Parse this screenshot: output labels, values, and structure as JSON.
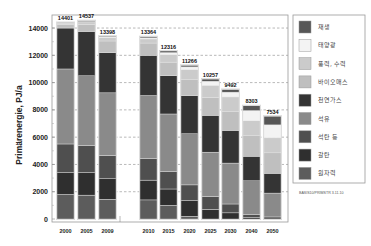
{
  "chart_data": {
    "type": "bar",
    "stacked": true,
    "title": "",
    "xlabel": "",
    "ylabel": "Primärenergie, PJ/a",
    "ylim": [
      0,
      15000
    ],
    "yticks": [
      0,
      2000,
      4000,
      6000,
      8000,
      10000,
      12000,
      14000
    ],
    "grid": "horizontal dashed",
    "legend_position": "right",
    "categories": [
      "2000",
      "2005",
      "2009",
      "2010",
      "2015",
      "2020",
      "2025",
      "2030",
      "2040",
      "2050"
    ],
    "totals": [
      14401,
      14537,
      13398,
      13364,
      12316,
      11266,
      10257,
      9492,
      8303,
      7534
    ],
    "series": [
      {
        "name": "원자력",
        "color": "#5c5c5c",
        "values": [
          1800,
          1750,
          1450,
          1400,
          1000,
          200,
          0,
          0,
          0,
          0
        ]
      },
      {
        "name": "갈탄",
        "color": "#2f2f2f",
        "values": [
          1600,
          1650,
          1500,
          1450,
          1200,
          1150,
          700,
          450,
          100,
          0
        ]
      },
      {
        "name": "석탄 등",
        "color": "#4f4f4f",
        "values": [
          2100,
          2000,
          1700,
          1600,
          1300,
          1150,
          950,
          650,
          250,
          150
        ]
      },
      {
        "name": "석유",
        "color": "#8a8a8a",
        "values": [
          5500,
          5100,
          4600,
          4600,
          4200,
          3750,
          3250,
          3000,
          2450,
          1750
        ]
      },
      {
        "name": "천연가스",
        "color": "#343434",
        "values": [
          3000,
          3250,
          2950,
          2950,
          2800,
          2800,
          2700,
          2400,
          1800,
          1450
        ]
      },
      {
        "name": "바이오매스",
        "color": "#bfbfbf",
        "values": [
          250,
          500,
          850,
          900,
          1000,
          1200,
          1300,
          1400,
          1500,
          1500
        ]
      },
      {
        "name": "풍력, 수력",
        "color": "#cbcbcb",
        "values": [
          100,
          200,
          250,
          300,
          550,
          700,
          900,
          1050,
          1100,
          1100
        ]
      },
      {
        "name": "태양광",
        "color": "#f3f3f3",
        "values": [
          10,
          30,
          60,
          80,
          150,
          200,
          300,
          350,
          750,
          950
        ]
      },
      {
        "name": "재생",
        "color": "#565656",
        "values": [
          41,
          57,
          38,
          84,
          116,
          116,
          157,
          192,
          353,
          634
        ]
      }
    ],
    "legend_order": [
      "재생",
      "태양광",
      "풍력, 수력",
      "바이오매스",
      "천연가스",
      "석유",
      "석탄 등",
      "갈탄",
      "원자력"
    ],
    "annotations": [
      "BASIS10/PRIMSTR 3.11.10"
    ]
  },
  "footnote": "BASIS10/PRIMSTR 3.11.10"
}
